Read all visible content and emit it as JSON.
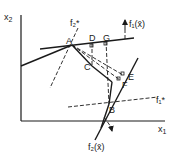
{
  "axes": {
    "x_label": "x",
    "x_sub": "1",
    "y_label": "x",
    "y_sub": "2"
  },
  "points": [
    {
      "id": "A",
      "label": "A"
    },
    {
      "id": "B",
      "label": "B"
    },
    {
      "id": "C",
      "label": "C"
    },
    {
      "id": "D",
      "label": "D"
    },
    {
      "id": "E",
      "label": "E"
    },
    {
      "id": "F",
      "label": "F"
    },
    {
      "id": "G",
      "label": "G"
    }
  ],
  "labels": {
    "f1_grad": "f₁(x̄)",
    "f2_grad": "f₂(x̄)",
    "f1_star": "f₁*",
    "f2_star": "f₂*"
  },
  "colors": {
    "ink": "#1a1a1a",
    "background": "#ffffff"
  }
}
